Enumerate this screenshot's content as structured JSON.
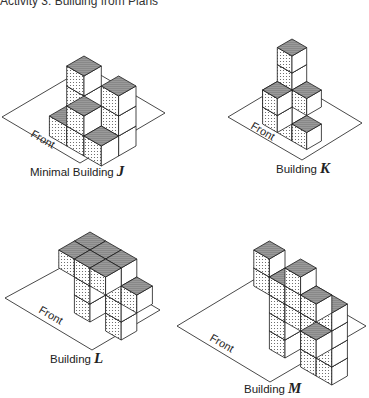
{
  "title": "Activity 3: Building from Plans",
  "colors": {
    "line": "#1a1a1a",
    "top_fill": "#8c8c8c",
    "dot": "#555555",
    "right_fill": "#ffffff",
    "plane": "#ffffff"
  },
  "buildings": [
    {
      "id": "J",
      "prefix": "Minimal Building",
      "letter": "J",
      "front_label": "Front",
      "origin": [
        84,
        116
      ],
      "unit": 20,
      "plane": [
        [
          2,
          117
        ],
        [
          80,
          163
        ],
        [
          165,
          113
        ],
        [
          87,
          67
        ]
      ],
      "front_pos": [
        30,
        136
      ],
      "front_rot": 30,
      "label_pos": [
        30,
        163
      ],
      "cubes": [
        [
          0,
          0,
          0
        ],
        [
          0,
          0,
          1
        ],
        [
          0,
          0,
          2
        ],
        [
          1,
          0,
          0
        ],
        [
          2,
          0,
          0
        ],
        [
          2,
          0,
          1
        ],
        [
          2,
          0,
          2
        ],
        [
          1,
          1,
          0
        ],
        [
          1,
          1,
          1
        ],
        [
          0,
          1,
          0
        ],
        [
          2,
          1,
          0
        ]
      ]
    },
    {
      "id": "K",
      "prefix": "Building",
      "letter": "K",
      "front_label": "Front",
      "origin": [
        292,
        124
      ],
      "unit": 17,
      "plane": [
        [
          228,
          117
        ],
        [
          302,
          160
        ],
        [
          362,
          123
        ],
        [
          290,
          80
        ]
      ],
      "front_pos": [
        250,
        128
      ],
      "front_rot": 30,
      "label_pos": [
        276,
        160
      ],
      "cubes": [
        [
          0,
          0,
          0
        ],
        [
          0,
          0,
          1
        ],
        [
          0,
          0,
          2
        ],
        [
          0,
          0,
          3
        ],
        [
          0,
          0,
          4
        ],
        [
          1,
          0,
          0
        ],
        [
          1,
          0,
          2
        ],
        [
          0,
          1,
          1
        ],
        [
          0,
          1,
          2
        ],
        [
          -1,
          0,
          1
        ]
      ]
    },
    {
      "id": "L",
      "prefix": "Building",
      "letter": "L",
      "front_label": "Front",
      "origin": [
        90,
        304
      ],
      "unit": 18,
      "plane": [
        [
          5,
          298
        ],
        [
          92,
          350
        ],
        [
          160,
          310
        ],
        [
          75,
          260
        ]
      ],
      "front_pos": [
        38,
        312
      ],
      "front_rot": 30,
      "label_pos": [
        50,
        350
      ],
      "cubes": [
        [
          0,
          0,
          0
        ],
        [
          0,
          0,
          1
        ],
        [
          0,
          0,
          2
        ],
        [
          0,
          0,
          3
        ],
        [
          2,
          0,
          0
        ],
        [
          2,
          0,
          1
        ],
        [
          2,
          0,
          2
        ],
        [
          2,
          0,
          3
        ],
        [
          1,
          0,
          3
        ],
        [
          3,
          0,
          2
        ],
        [
          0,
          1,
          3
        ],
        [
          1,
          1,
          3
        ],
        [
          2,
          1,
          3
        ]
      ]
    },
    {
      "id": "M",
      "prefix": "Building",
      "letter": "M",
      "front_label": "Front",
      "origin": [
        285,
        340
      ],
      "unit": 18,
      "plane": [
        [
          177,
          326
        ],
        [
          270,
          382
        ],
        [
          366,
          326
        ],
        [
          270,
          270
        ]
      ],
      "front_pos": [
        209,
        340
      ],
      "front_rot": 30,
      "label_pos": [
        244,
        380
      ],
      "cubes": [
        [
          0,
          0,
          0
        ],
        [
          0,
          0,
          1
        ],
        [
          0,
          0,
          2
        ],
        [
          0,
          0,
          3
        ],
        [
          2,
          0,
          0
        ],
        [
          2,
          0,
          1
        ],
        [
          2,
          0,
          2
        ],
        [
          2,
          0,
          3
        ],
        [
          3,
          0,
          0
        ],
        [
          3,
          0,
          1
        ],
        [
          3,
          0,
          2
        ],
        [
          3,
          0,
          3
        ],
        [
          1,
          0,
          2
        ],
        [
          3,
          1,
          2
        ],
        [
          0,
          1,
          4
        ],
        [
          1,
          1,
          4
        ],
        [
          2,
          1,
          4
        ],
        [
          3,
          1,
          4
        ],
        [
          0,
          1,
          5
        ],
        [
          2,
          1,
          5
        ]
      ]
    }
  ]
}
